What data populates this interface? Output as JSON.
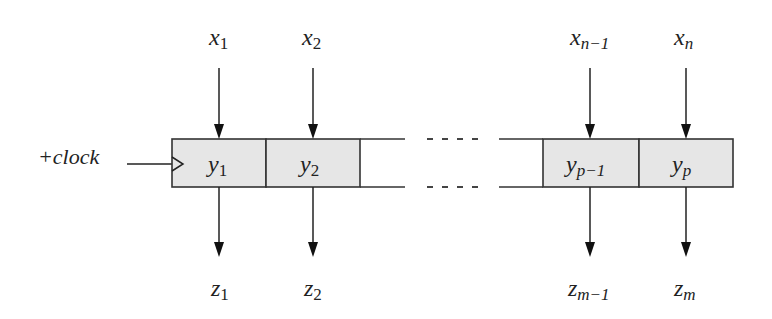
{
  "diagram": {
    "type": "shift-register / register block",
    "clock": {
      "label": "+clock"
    },
    "inputs": [
      {
        "name": "x",
        "sub": "1"
      },
      {
        "name": "x",
        "sub": "2"
      },
      {
        "name": "x",
        "sub": "n−1"
      },
      {
        "name": "x",
        "sub": "n"
      }
    ],
    "cells": [
      {
        "name": "y",
        "sub": "1"
      },
      {
        "name": "y",
        "sub": "2"
      },
      {
        "name": "y",
        "sub": "p−1"
      },
      {
        "name": "y",
        "sub": "p"
      }
    ],
    "outputs": [
      {
        "name": "z",
        "sub": "1"
      },
      {
        "name": "z",
        "sub": "2"
      },
      {
        "name": "z",
        "sub": "m−1"
      },
      {
        "name": "z",
        "sub": "m"
      }
    ],
    "ellipsis": "…",
    "colors": {
      "cell_fill": "#e6e6e6",
      "stroke": "#333333",
      "text": "#222222"
    }
  }
}
